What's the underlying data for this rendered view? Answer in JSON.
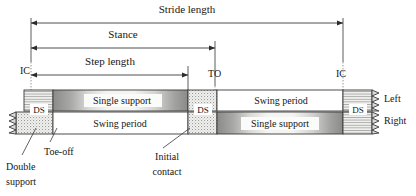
{
  "figure": {
    "title_top": "Stride length",
    "background": "#ffffff",
    "ink": "#1a1a1a"
  },
  "dimensions": [
    {
      "id": "stride",
      "label": "Stride length",
      "x1": 31,
      "x2": 343,
      "y": 23,
      "label_x": 187,
      "label_y": 13
    },
    {
      "id": "stance",
      "label": "Stance",
      "x1": 31,
      "x2": 215,
      "y": 48,
      "label_x": 123,
      "label_y": 38
    },
    {
      "id": "step",
      "label": "Step length",
      "x1": 31,
      "x2": 188,
      "y": 75,
      "label_x": 110,
      "label_y": 65
    }
  ],
  "event_markers": [
    {
      "id": "ic-left",
      "label": "IC",
      "x": 31,
      "label_x": 25,
      "label_y": 72
    },
    {
      "id": "to",
      "label": "TO",
      "x": 215,
      "label_x": 210,
      "label_y": 75
    },
    {
      "id": "ic-right",
      "label": "IC",
      "x": 343,
      "label_x": 338,
      "label_y": 75
    }
  ],
  "bars": {
    "left": {
      "name": "Left",
      "y": 90,
      "height": 21,
      "x_start": 24,
      "x_end": 372,
      "segments": [
        {
          "id": "ds-1",
          "kind": "double-support",
          "label": "DS",
          "x": 24,
          "w": 29
        },
        {
          "id": "ss-left",
          "kind": "single-support",
          "label": "Single support",
          "x": 53,
          "w": 135
        },
        {
          "id": "ds-2",
          "kind": "double-support",
          "label": "DS",
          "x": 188,
          "w": 29
        },
        {
          "id": "swing-left",
          "kind": "swing",
          "label": "Swing period",
          "x": 217,
          "w": 126
        },
        {
          "id": "ds-3",
          "kind": "double-support",
          "label": "DS",
          "x": 343,
          "w": 29
        }
      ]
    },
    "right": {
      "name": "Right",
      "y": 112,
      "height": 22,
      "x_start": 16,
      "x_end": 372,
      "segments": [
        {
          "id": "ds-r0",
          "kind": "double-support",
          "label": "",
          "x": 16,
          "w": 37
        },
        {
          "id": "swing-right",
          "kind": "swing",
          "label": "Swing period",
          "x": 53,
          "w": 135
        },
        {
          "id": "ds-r1",
          "kind": "double-support",
          "label": "",
          "x": 188,
          "w": 29
        },
        {
          "id": "ss-right",
          "kind": "single-support",
          "label": "Single support",
          "x": 217,
          "w": 126
        },
        {
          "id": "ds-r2",
          "kind": "double-support",
          "label": "",
          "x": 343,
          "w": 29
        }
      ]
    }
  },
  "ds_labels": [
    {
      "id": "ds-label-1",
      "text": "DS",
      "x": 38,
      "y": 108
    },
    {
      "id": "ds-label-2",
      "text": "DS",
      "x": 202,
      "y": 108
    },
    {
      "id": "ds-label-3",
      "text": "DS",
      "x": 357,
      "y": 108
    }
  ],
  "side_labels": [
    {
      "id": "side-left",
      "text": "Left",
      "x": 380,
      "y": 101
    },
    {
      "id": "side-right",
      "text": "Right",
      "x": 380,
      "y": 122
    }
  ],
  "callouts": [
    {
      "id": "double-support-callout",
      "lines": [
        "Double",
        "support"
      ],
      "text_x": 8,
      "text_y": 168,
      "leader": {
        "x1": 36,
        "y1": 128,
        "x2": 22,
        "y2": 154
      }
    },
    {
      "id": "toe-off-callout",
      "lines": [
        "Toe-off"
      ],
      "text_x": 52,
      "text_y": 150,
      "leader": {
        "x1": 56,
        "y1": 128,
        "x2": 50,
        "y2": 140
      }
    },
    {
      "id": "initial-contact-callout",
      "lines": [
        "Initial",
        "contact"
      ],
      "text_x": 143,
      "text_y": 156,
      "leader": {
        "x1": 188,
        "y1": 128,
        "x2": 162,
        "y2": 146
      }
    }
  ],
  "legend_keys": {
    "double_support": "dotted-stipple",
    "single_support": "gray-gradient-block",
    "swing": "white-block",
    "break_symbol": "zigzag-break"
  }
}
